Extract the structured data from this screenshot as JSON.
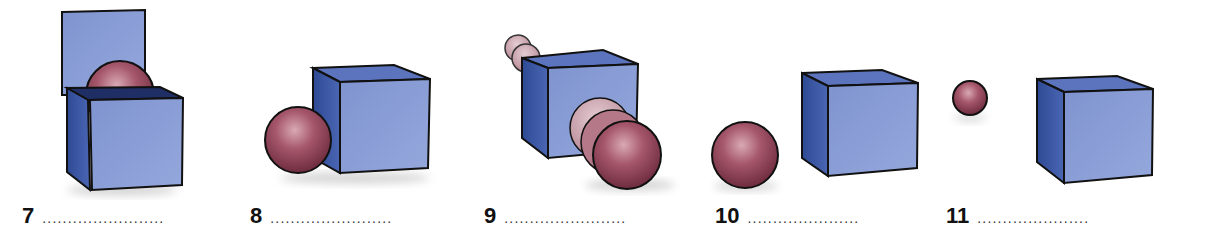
{
  "colors": {
    "cube_front": "#8096d4",
    "cube_side": "#3d5aa8",
    "cube_top": "#5b74bd",
    "ball": "#9a4a5e",
    "outline": "#111111"
  },
  "exercises": [
    {
      "number": "7",
      "answer_blank": "........................",
      "scene": "ball-in-open-box"
    },
    {
      "number": "8",
      "answer_blank": "........................",
      "scene": "ball-next-to-box"
    },
    {
      "number": "9",
      "answer_blank": "........................",
      "scene": "ball-through-box"
    },
    {
      "number": "10",
      "answer_blank": "......................",
      "scene": "ball-beside-box-gap"
    },
    {
      "number": "11",
      "answer_blank": "......................",
      "scene": "small-ball-away-from-box"
    }
  ]
}
